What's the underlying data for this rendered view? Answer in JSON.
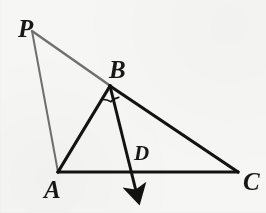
{
  "figure": {
    "kind": "geometry-diagram",
    "canvas": {
      "width": 266,
      "height": 213
    },
    "background_color": "#f6f6f5"
  },
  "colors": {
    "ink_black": "#121212",
    "ink_gray": "#6f6f6f",
    "label_ink": "#171717",
    "background": "#f6f6f5"
  },
  "points": {
    "P": {
      "label": "P",
      "x": 32,
      "y": 31,
      "label_x": 18,
      "label_y": 16,
      "label_size": "major"
    },
    "B": {
      "label": "B",
      "x": 110,
      "y": 86,
      "label_x": 109,
      "label_y": 57,
      "label_size": "major"
    },
    "A": {
      "label": "A",
      "x": 58,
      "y": 172,
      "label_x": 44,
      "label_y": 177,
      "label_size": "major"
    },
    "C": {
      "label": "C",
      "x": 238,
      "y": 172,
      "label_x": 243,
      "label_y": 169,
      "label_size": "major"
    },
    "D": {
      "label": "D",
      "x": 130,
      "y": 172,
      "label_x": 134,
      "label_y": 143,
      "label_size": "minor"
    }
  },
  "segments": [
    {
      "name": "segment-PA",
      "from": "P",
      "to": "A",
      "color": "#6f6f6f",
      "width": 2.0,
      "x1": 32,
      "y1": 31,
      "x2": 58,
      "y2": 172
    },
    {
      "name": "segment-PB",
      "from": "P",
      "to": "B",
      "color": "#6f6f6f",
      "width": 2.4,
      "x1": 32,
      "y1": 31,
      "x2": 112,
      "y2": 87
    },
    {
      "name": "segment-BC",
      "from": "B",
      "to": "C",
      "color": "#121212",
      "width": 3.2,
      "x1": 110,
      "y1": 86,
      "x2": 238,
      "y2": 172
    },
    {
      "name": "segment-AB",
      "from": "A",
      "to": "B",
      "color": "#121212",
      "width": 3.2,
      "x1": 58,
      "y1": 172,
      "x2": 110,
      "y2": 86
    },
    {
      "name": "segment-AC",
      "from": "A",
      "to": "C",
      "color": "#121212",
      "width": 3.0,
      "x1": 58,
      "y1": 172,
      "x2": 238,
      "y2": 172
    }
  ],
  "ray": {
    "name": "ray-BD-arrow",
    "from": "B",
    "through": "D",
    "color": "#121212",
    "width": 3.0,
    "x1": 110,
    "y1": 86,
    "x2": 137,
    "y2": 196,
    "arrowhead": true
  },
  "angle_marks": {
    "name": "equal-angle-arcs-at-B",
    "vertex": "B",
    "count": 2,
    "color": "#121212",
    "width": 1.6,
    "meaning": "angle ABD equals angle DBC",
    "arc_left": "M 101.6 99.5 A 15 15 0 0 1 110.6 101.4",
    "arc_right": "M 110.6 101.4 A 15 15 0 0 1 118.6 97.6"
  },
  "label_order": [
    "P",
    "B",
    "D",
    "A",
    "C"
  ]
}
